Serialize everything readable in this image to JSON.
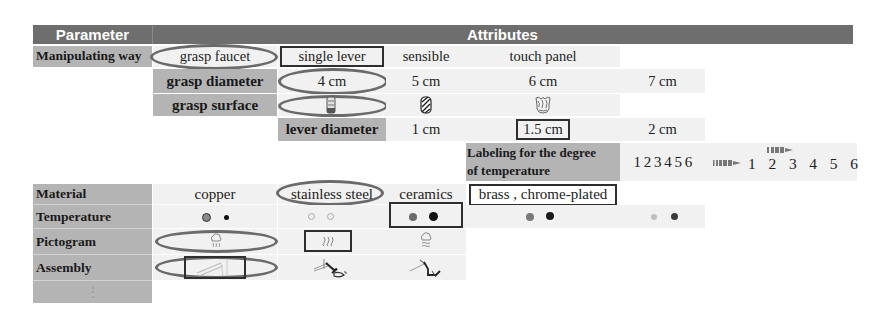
{
  "header": {
    "parameter": "Parameter",
    "attributes": "Attributes",
    "bg_color": "#6e6e6e"
  },
  "rows": {
    "manipulating_way": {
      "label": "Manipulating way",
      "options": [
        "grasp faucet",
        "single lever",
        "sensible",
        "touch panel"
      ],
      "oval_selected": "grasp faucet",
      "box_selected": "single lever"
    },
    "grasp_diameter": {
      "label": "grasp diameter",
      "options": [
        "4 cm",
        "5 cm",
        "6 cm",
        "7 cm"
      ],
      "oval_selected": "4 cm"
    },
    "grasp_surface": {
      "label": "grasp surface",
      "options": [
        "smooth-grip-icon",
        "diagonal-ribbed-grip-icon",
        "knurled-grip-icon"
      ],
      "oval_selected": "smooth-grip-icon"
    },
    "lever_diameter": {
      "label": "lever diameter",
      "options": [
        "1 cm",
        "1.5 cm",
        "2 cm"
      ],
      "box_selected": "1.5 cm"
    },
    "labeling": {
      "label_line1": "Labeling for the degree",
      "label_line2": "of temperature",
      "options": [
        "1 2 3 4 5 6",
        "1 2 3 4 5 6"
      ],
      "option1": "1 2 3 4 5 6",
      "option2_digits": [
        "1",
        "2",
        "3",
        "4",
        "5",
        "6"
      ],
      "arrow_icon": "bar-arrow-icon"
    },
    "material": {
      "label": "Material",
      "options": [
        "copper",
        "stainless steel",
        "ceramics",
        "brass , chrome-plated"
      ],
      "oval_selected": "stainless steel",
      "box_selected": "brass , chrome-plated"
    },
    "temperature": {
      "label": "Temperature",
      "options": [
        {
          "name": "filled-grey-and-black-dots",
          "colors": [
            "#8a8a8a",
            "#1a1a1a"
          ]
        },
        {
          "name": "hollow-light-rings",
          "colors": [
            "#bdbdbd",
            "#bdbdbd"
          ]
        },
        {
          "name": "dark-grey-and-black-dots",
          "colors": [
            "#6a6a6a",
            "#111111"
          ]
        },
        {
          "name": "grey-and-black-dots",
          "colors": [
            "#7a7a7a",
            "#1a1a1a"
          ]
        },
        {
          "name": "light-grey-and-dark-dots",
          "colors": [
            "#bfbfbf",
            "#3a3a3a"
          ]
        }
      ],
      "box_selected": "dark-grey-and-black-dots"
    },
    "pictogram": {
      "label": "Pictogram",
      "options": [
        "steam-cloud-icon",
        "heat-waves-icon",
        "cloud-waves-icon"
      ],
      "oval_selected": "steam-cloud-icon",
      "box_selected": "heat-waves-icon"
    },
    "assembly": {
      "label": "Assembly",
      "options": [
        "wall-spout-icon",
        "lever-mixer-icon",
        "deck-mounted-faucet-icon"
      ],
      "oval_selected": "wall-spout-icon",
      "box_selected": "wall-spout-icon"
    },
    "more": {
      "label": "⋮"
    }
  }
}
